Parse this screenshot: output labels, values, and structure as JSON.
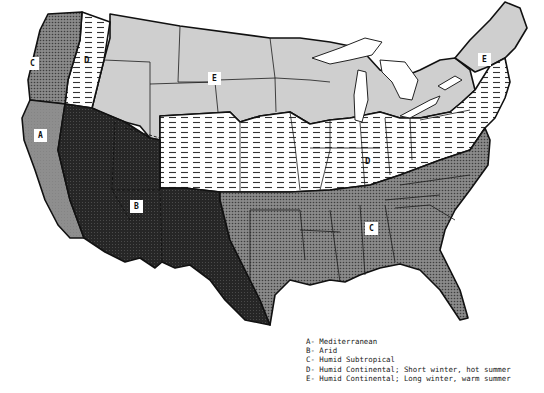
{
  "map": {
    "title": "Climate regions of the contiguous United States",
    "zones": [
      {
        "code": "A",
        "name": "Mediterranean",
        "pattern": "medium-gray stipple",
        "color": "#8c8c8c"
      },
      {
        "code": "B",
        "name": "Arid",
        "pattern": "dark stipple",
        "color": "#2a2a2a"
      },
      {
        "code": "C",
        "name": "Humid Subtropical",
        "pattern": "gray crosshatch",
        "color": "#6e6e6e"
      },
      {
        "code": "D",
        "name": "Humid Continental; Short winter, hot summer",
        "pattern": "horizontal dashes",
        "color": "#ffffff"
      },
      {
        "code": "E",
        "name": "Humid Continental; Long winter, warm summer",
        "pattern": "light gray",
        "color": "#cfcfcf"
      }
    ],
    "labels": {
      "pacific_nw_c": "C",
      "pacific_nw_d": "D",
      "california_a": "A",
      "southwest_b": "B",
      "northern_plains_e": "E",
      "new_england_e": "E",
      "midwest_d": "D",
      "southeast_c": "C"
    }
  },
  "legend": {
    "items": [
      "A- Mediterranean",
      "B- Arid",
      "C- Humid Subtropical",
      "D- Humid Continental; Short winter, hot summer",
      "E- Humid Continental; Long winter, warm summer"
    ]
  }
}
